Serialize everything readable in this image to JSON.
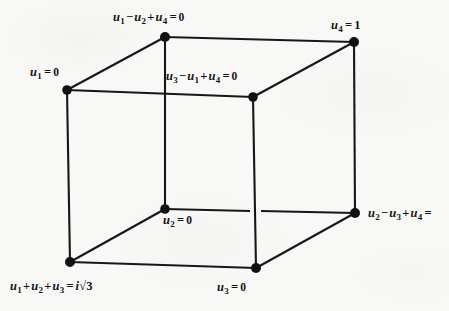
{
  "figure": {
    "type": "cube-diagram",
    "background_color": "#f8f8f6",
    "ink_color": "#141414"
  },
  "labels": {
    "top_back": {
      "text": "u1 - u2 + u4 = 0",
      "terms": [
        "u",
        "1",
        "-",
        "u",
        "2",
        "+",
        "u",
        "4",
        "=",
        "0"
      ],
      "var1": "u",
      "sub1": "1",
      "op1": "−",
      "var2": "u",
      "sub2": "2",
      "op2": "+",
      "var3": "u",
      "sub3": "4",
      "equals": "=",
      "value": "0"
    },
    "top_right": {
      "text": "u4 = 1",
      "var1": "u",
      "sub1": "4",
      "equals": "=",
      "value": "1"
    },
    "left_top": {
      "text": "u1 = 0",
      "var1": "u",
      "sub1": "1",
      "equals": "=",
      "value": "0"
    },
    "inner_top": {
      "text": "u3 - u1 + u4 = 0",
      "var1": "u",
      "sub1": "3",
      "op1": "−",
      "var2": "u",
      "sub2": "1",
      "op2": "+",
      "var3": "u",
      "sub3": "4",
      "equals": "=",
      "value": "0"
    },
    "inner_bottom": {
      "text": "u2 = 0",
      "var1": "u",
      "sub1": "2",
      "equals": "=",
      "value": "0"
    },
    "right_bottom": {
      "text": "u2 - u3 + u4 =",
      "var1": "u",
      "sub1": "2",
      "op1": "−",
      "var2": "u",
      "sub2": "3",
      "op2": "+",
      "var3": "u",
      "sub3": "4",
      "equals": "=",
      "value": "",
      "truncated": true
    },
    "bottom_left": {
      "text": "u1 + u2 + u3 = i√3",
      "var1": "u",
      "sub1": "1",
      "op1": "+",
      "var2": "u",
      "sub2": "2",
      "op2": "+",
      "var3": "u",
      "sub3": "3",
      "equals": "=",
      "imag": "i",
      "radical": "√",
      "radicand": "3"
    },
    "bottom_mid": {
      "text": "u3 = 0",
      "var1": "u",
      "sub1": "3",
      "equals": "=",
      "value": "0"
    }
  },
  "geometry": {
    "vertices": [
      {
        "name": "front-top-left",
        "x": 67,
        "y": 90,
        "label": "left_top"
      },
      {
        "name": "back-top-left",
        "x": 165,
        "y": 37,
        "label": "top_back"
      },
      {
        "name": "back-top-right",
        "x": 354,
        "y": 42,
        "label": "top_right"
      },
      {
        "name": "front-top-right",
        "x": 253,
        "y": 97,
        "label": "inner_top"
      },
      {
        "name": "front-bot-left",
        "x": 70,
        "y": 262,
        "label": "bottom_left"
      },
      {
        "name": "back-bot-left",
        "x": 165,
        "y": 209,
        "label": "inner_bottom"
      },
      {
        "name": "back-bot-right",
        "x": 355,
        "y": 213,
        "label": "right_bottom"
      },
      {
        "name": "front-bot-right",
        "x": 256,
        "y": 268,
        "label": "bottom_mid"
      }
    ],
    "edges": [
      [
        "front-top-left",
        "back-top-left"
      ],
      [
        "back-top-left",
        "back-top-right"
      ],
      [
        "back-top-right",
        "front-top-right"
      ],
      [
        "front-top-right",
        "front-top-left"
      ],
      [
        "front-bot-left",
        "back-bot-left"
      ],
      [
        "back-bot-left",
        "back-bot-right"
      ],
      [
        "back-bot-right",
        "front-bot-right"
      ],
      [
        "front-bot-right",
        "front-bot-left"
      ],
      [
        "front-top-left",
        "front-bot-left"
      ],
      [
        "back-top-left",
        "back-bot-left"
      ],
      [
        "back-top-right",
        "back-bot-right"
      ],
      [
        "front-top-right",
        "front-bot-right"
      ]
    ],
    "vertex_dot_radius": 4.6
  }
}
